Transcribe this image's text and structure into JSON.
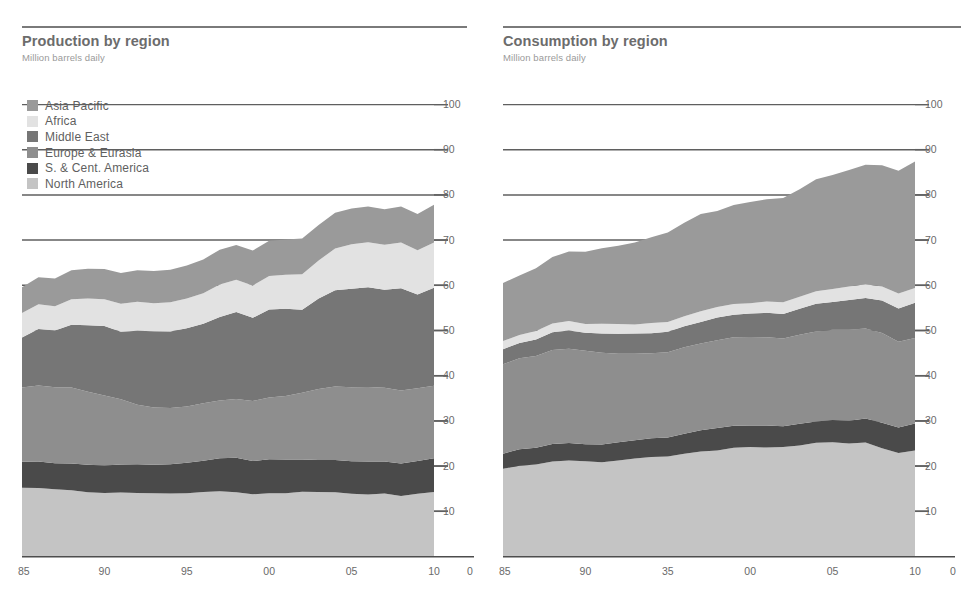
{
  "page": {
    "background": "#ffffff",
    "text_color": "#6f6f6f"
  },
  "panels": [
    {
      "id": "production",
      "title": "Production by region",
      "subtitle": "Million barrels daily"
    },
    {
      "id": "consumption",
      "title": "Consumption by region",
      "subtitle": "Million barrels daily"
    }
  ],
  "legend": {
    "position": "top-left",
    "items": [
      {
        "label": "Asia Pacific",
        "color": "#9a9a9a"
      },
      {
        "label": "Africa",
        "color": "#e2e2e2"
      },
      {
        "label": "Middle East",
        "color": "#767676"
      },
      {
        "label": "Europe & Eurasia",
        "color": "#8e8e8e"
      },
      {
        "label": "S. & Cent. America",
        "color": "#4a4a4a"
      },
      {
        "label": "North America",
        "color": "#c4c4c4"
      }
    ]
  },
  "axes": {
    "y_ticks": [
      100,
      90,
      80,
      70,
      60,
      50,
      40,
      30,
      20,
      10
    ],
    "y_min": 0,
    "y_max": 100,
    "y_label_side": "right",
    "x_ticks_production": [
      "85",
      "90",
      "95",
      "00",
      "05",
      "10",
      "0"
    ],
    "x_ticks_consumption": [
      "85",
      "90",
      "35",
      "00",
      "05",
      "10",
      "0"
    ],
    "x_min": 1985,
    "x_max": 2010,
    "grid": true,
    "grid_color": "#5f5f5f"
  },
  "chart_data": [
    {
      "type": "area",
      "id": "production",
      "stacked": true,
      "title": "Production by region",
      "subtitle": "Million barrels daily",
      "xlabel": "",
      "ylabel": "Million barrels daily",
      "ylim": [
        0,
        100
      ],
      "xlim": [
        1985,
        2010
      ],
      "legend_position": "top-left",
      "x": [
        1985,
        1986,
        1987,
        1988,
        1989,
        1990,
        1991,
        1992,
        1993,
        1994,
        1995,
        1996,
        1997,
        1998,
        1999,
        2000,
        2001,
        2002,
        2003,
        2004,
        2005,
        2006,
        2007,
        2008,
        2009,
        2010
      ],
      "stack_order_bottom_to_top": [
        "North America",
        "S. & Cent. America",
        "Europe & Eurasia",
        "Middle East",
        "Africa",
        "Asia Pacific"
      ],
      "series": [
        {
          "name": "North America",
          "color": "#c4c4c4",
          "values": [
            15.2,
            15.0,
            14.8,
            14.6,
            14.2,
            14.0,
            14.0,
            13.9,
            13.8,
            13.9,
            14.0,
            14.1,
            14.2,
            14.2,
            13.7,
            13.9,
            13.9,
            14.2,
            14.2,
            14.1,
            13.7,
            13.7,
            13.7,
            13.3,
            13.8,
            14.1
          ]
        },
        {
          "name": "S. & Cent. America",
          "color": "#4a4a4a",
          "values": [
            5.8,
            5.8,
            5.8,
            5.9,
            6.0,
            6.1,
            6.2,
            6.3,
            6.4,
            6.6,
            6.8,
            7.0,
            7.3,
            7.5,
            7.4,
            7.5,
            7.4,
            7.2,
            7.0,
            7.2,
            7.3,
            7.4,
            7.2,
            7.2,
            7.2,
            7.4
          ]
        },
        {
          "name": "Europe & Eurasia",
          "color": "#8e8e8e",
          "values": [
            16.5,
            16.8,
            16.9,
            16.8,
            16.2,
            15.6,
            14.3,
            13.2,
            12.6,
            12.4,
            12.5,
            12.8,
            12.9,
            13.0,
            13.2,
            13.6,
            14.1,
            14.9,
            15.7,
            16.2,
            16.4,
            16.4,
            16.3,
            16.1,
            16.0,
            16.0
          ]
        },
        {
          "name": "Middle East",
          "color": "#767676",
          "values": [
            11.0,
            12.5,
            12.5,
            13.8,
            14.6,
            15.4,
            14.9,
            16.3,
            16.8,
            17.0,
            17.4,
            17.7,
            18.5,
            19.2,
            18.5,
            19.5,
            19.3,
            18.4,
            20.0,
            21.2,
            21.8,
            22.0,
            21.6,
            22.5,
            20.8,
            21.7
          ]
        },
        {
          "name": "Africa",
          "color": "#e2e2e2",
          "values": [
            5.4,
            5.5,
            5.4,
            5.6,
            5.8,
            6.0,
            6.1,
            6.3,
            6.3,
            6.4,
            6.6,
            6.8,
            7.1,
            7.2,
            7.2,
            7.5,
            7.5,
            7.8,
            8.3,
            9.2,
            9.8,
            9.9,
            9.9,
            10.1,
            9.7,
            10.1
          ]
        },
        {
          "name": "Asia Pacific",
          "color": "#9a9a9a",
          "values": [
            5.7,
            6.0,
            6.1,
            6.4,
            6.6,
            6.7,
            6.8,
            7.0,
            7.1,
            7.2,
            7.3,
            7.5,
            7.7,
            7.7,
            7.7,
            7.8,
            7.8,
            7.9,
            7.9,
            7.9,
            7.9,
            7.9,
            7.9,
            8.0,
            8.0,
            8.3
          ]
        }
      ]
    },
    {
      "type": "area",
      "id": "consumption",
      "stacked": true,
      "title": "Consumption by region",
      "subtitle": "Million barrels daily",
      "xlabel": "",
      "ylabel": "Million barrels daily",
      "ylim": [
        0,
        100
      ],
      "xlim": [
        1985,
        2010
      ],
      "legend_position": "shared-left-panel",
      "x": [
        1985,
        1986,
        1987,
        1988,
        1989,
        1990,
        1991,
        1992,
        1993,
        1994,
        1995,
        1996,
        1997,
        1998,
        1999,
        2000,
        2001,
        2002,
        2003,
        2004,
        2005,
        2006,
        2007,
        2008,
        2009,
        2010
      ],
      "stack_order_bottom_to_top": [
        "North America",
        "S. & Cent. America",
        "Europe & Eurasia",
        "Middle East",
        "Africa",
        "Asia Pacific"
      ],
      "series": [
        {
          "name": "North America",
          "color": "#c4c4c4",
          "values": [
            19.4,
            19.9,
            20.3,
            21.0,
            21.2,
            21.0,
            20.7,
            21.1,
            21.5,
            22.0,
            22.1,
            22.6,
            23.0,
            23.4,
            24.0,
            24.1,
            24.0,
            24.1,
            24.5,
            25.0,
            25.1,
            25.0,
            25.0,
            23.9,
            22.8,
            23.3
          ]
        },
        {
          "name": "S. & Cent. America",
          "color": "#4a4a4a",
          "values": [
            3.4,
            3.6,
            3.7,
            3.8,
            3.8,
            3.8,
            3.9,
            4.0,
            4.1,
            4.2,
            4.3,
            4.5,
            4.7,
            4.9,
            4.9,
            4.8,
            4.8,
            4.7,
            4.7,
            4.8,
            5.0,
            5.1,
            5.4,
            5.6,
            5.6,
            5.9
          ]
        },
        {
          "name": "Europe & Eurasia",
          "color": "#8e8e8e",
          "values": [
            19.8,
            20.1,
            20.4,
            20.8,
            20.9,
            20.8,
            20.2,
            19.6,
            19.1,
            18.8,
            18.9,
            19.2,
            19.3,
            19.4,
            19.5,
            19.5,
            19.6,
            19.5,
            19.7,
            19.9,
            20.0,
            20.1,
            19.9,
            19.8,
            18.9,
            18.9
          ]
        },
        {
          "name": "Middle East",
          "color": "#767676",
          "values": [
            3.3,
            3.4,
            3.6,
            3.8,
            3.9,
            4.0,
            4.2,
            4.3,
            4.4,
            4.5,
            4.6,
            4.7,
            4.8,
            5.0,
            5.1,
            5.2,
            5.4,
            5.5,
            5.7,
            6.0,
            6.2,
            6.5,
            6.7,
            7.1,
            7.4,
            7.8
          ]
        },
        {
          "name": "Africa",
          "color": "#e2e2e2",
          "values": [
            1.8,
            1.8,
            1.9,
            1.9,
            2.0,
            2.0,
            2.1,
            2.1,
            2.1,
            2.2,
            2.2,
            2.3,
            2.3,
            2.4,
            2.4,
            2.4,
            2.5,
            2.5,
            2.6,
            2.7,
            2.8,
            2.9,
            3.0,
            3.1,
            3.2,
            3.3
          ]
        },
        {
          "name": "Asia Pacific",
          "color": "#9a9a9a",
          "values": [
            12.8,
            13.2,
            13.9,
            14.7,
            15.4,
            16.0,
            16.7,
            17.3,
            18.1,
            19.0,
            19.8,
            20.7,
            21.5,
            21.2,
            21.9,
            22.4,
            22.6,
            23.1,
            23.8,
            24.8,
            25.2,
            25.8,
            26.4,
            26.8,
            27.2,
            28.0
          ]
        }
      ]
    }
  ]
}
